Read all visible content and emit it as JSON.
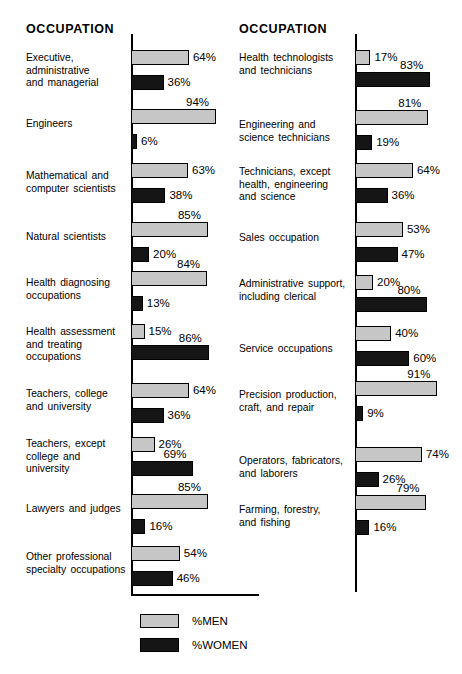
{
  "panels": [
    {
      "id": "left",
      "heading": "OCCUPATION",
      "axis": {
        "x": 131,
        "top": 34,
        "bottom": 594,
        "base_width": 128
      },
      "groups": [
        {
          "label": "Executive,\nadministrative\nand managerial",
          "label_top": 52,
          "men": 64,
          "women": 36,
          "men_top": 50,
          "women_top": 75
        },
        {
          "label": "Engineers",
          "label_top": 118,
          "men": 94,
          "women": 6,
          "men_top": 109,
          "women_top": 134
        },
        {
          "label": "Mathematical and\ncomputer scientists",
          "label_top": 170,
          "men": 63,
          "women": 38,
          "men_top": 163,
          "women_top": 188
        },
        {
          "label": "Natural scientists",
          "label_top": 231,
          "men": 85,
          "women": 20,
          "men_top": 222,
          "women_top": 247
        },
        {
          "label": "Health diagnosing\noccupations",
          "label_top": 277,
          "men": 84,
          "women": 13,
          "men_top": 271,
          "women_top": 296
        },
        {
          "label": "Health assessment\nand treating\noccupations",
          "label_top": 326,
          "men": 15,
          "women": 86,
          "men_top": 324,
          "women_top": 345
        },
        {
          "label": "Teachers, college\nand university",
          "label_top": 388,
          "men": 64,
          "women": 36,
          "men_top": 383,
          "women_top": 408
        },
        {
          "label": "Teachers, except\ncollege and\nuniversity",
          "label_top": 438,
          "men": 26,
          "women": 69,
          "men_top": 437,
          "women_top": 461
        },
        {
          "label": "Lawyers and judges",
          "label_top": 503,
          "men": 85,
          "women": 16,
          "men_top": 494,
          "women_top": 519
        },
        {
          "label": "Other professional\nspecialty occupations",
          "label_top": 551,
          "men": 54,
          "women": 46,
          "men_top": 546,
          "women_top": 571
        }
      ]
    },
    {
      "id": "right",
      "heading": "OCCUPATION",
      "axis": {
        "x": 124,
        "top": 34,
        "bottom": 592,
        "base_width": 0
      },
      "groups": [
        {
          "label": "Health technologists\nand technicians",
          "label_top": 52,
          "men": 17,
          "women": 83,
          "men_top": 50,
          "women_top": 72
        },
        {
          "label": "Engineering and\nscience technicians",
          "label_top": 119,
          "men": 81,
          "women": 19,
          "men_top": 110,
          "women_top": 135
        },
        {
          "label": "Technicians, except\nhealth, engineering\nand science",
          "label_top": 166,
          "men": 64,
          "women": 36,
          "men_top": 163,
          "women_top": 188
        },
        {
          "label": "Sales occupation",
          "label_top": 232,
          "men": 53,
          "women": 47,
          "men_top": 222,
          "women_top": 247
        },
        {
          "label": "Administrative support,\nincluding clerical",
          "label_top": 278,
          "men": 20,
          "women": 80,
          "men_top": 275,
          "women_top": 297
        },
        {
          "label": "Service occupations",
          "label_top": 343,
          "men": 40,
          "women": 60,
          "men_top": 326,
          "women_top": 351
        },
        {
          "label": "Precision production,\ncraft, and repair",
          "label_top": 389,
          "men": 91,
          "women": 9,
          "men_top": 381,
          "women_top": 406
        },
        {
          "label": "Operators, fabricators,\nand laborers",
          "label_top": 455,
          "men": 74,
          "women": 26,
          "men_top": 447,
          "women_top": 472
        },
        {
          "label": "Farming, forestry,\nand fishing",
          "label_top": 504,
          "men": 79,
          "women": 16,
          "men_top": 495,
          "women_top": 520
        }
      ]
    }
  ],
  "legend": {
    "men_label": "%MEN",
    "women_label": "%WOMEN",
    "men_color": "#c6c6c6",
    "women_color": "#151515"
  },
  "chart_data": {
    "type": "bar",
    "xlabel": "",
    "ylabel": "OCCUPATION",
    "xlim": [
      0,
      100
    ],
    "grid": false,
    "legend_position": "bottom-center",
    "units": "percent",
    "categories": [
      "Executive, administrative and managerial",
      "Engineers",
      "Mathematical and computer scientists",
      "Natural scientists",
      "Health diagnosing occupations",
      "Health assessment and treating occupations",
      "Teachers, college and university",
      "Teachers, except college and university",
      "Lawyers and judges",
      "Other professional specialty occupations",
      "Health technologists and technicians",
      "Engineering and science technicians",
      "Technicians, except health, engineering and science",
      "Sales occupation",
      "Administrative support, including clerical",
      "Service occupations",
      "Precision production, craft, and repair",
      "Operators, fabricators, and laborers",
      "Farming, forestry, and fishing"
    ],
    "series": [
      {
        "name": "%MEN",
        "values": [
          64,
          94,
          63,
          85,
          84,
          15,
          64,
          26,
          85,
          54,
          17,
          81,
          64,
          53,
          20,
          40,
          91,
          74,
          79
        ]
      },
      {
        "name": "%WOMEN",
        "values": [
          36,
          6,
          38,
          20,
          13,
          86,
          36,
          69,
          16,
          46,
          83,
          19,
          36,
          47,
          80,
          60,
          9,
          26,
          16
        ]
      }
    ]
  }
}
